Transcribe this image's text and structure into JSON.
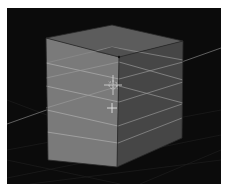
{
  "viewport": {
    "type": "3d-viewport",
    "background": "#0b0b0b",
    "object": "cube",
    "loop_cuts": 3,
    "colors": {
      "left_face": "#7a7a7a",
      "right_face": "#474747",
      "top_face": "#5e5e5e",
      "edge_highlight": "#a8a8a8",
      "grid_line": "#3a3a3a",
      "axis_line": "#6a6a6a"
    }
  },
  "cursor": {
    "name": "3d-cursor",
    "x": 113,
    "y": 85
  },
  "pivot": {
    "name": "crosshair",
    "x": 112,
    "y": 108
  }
}
